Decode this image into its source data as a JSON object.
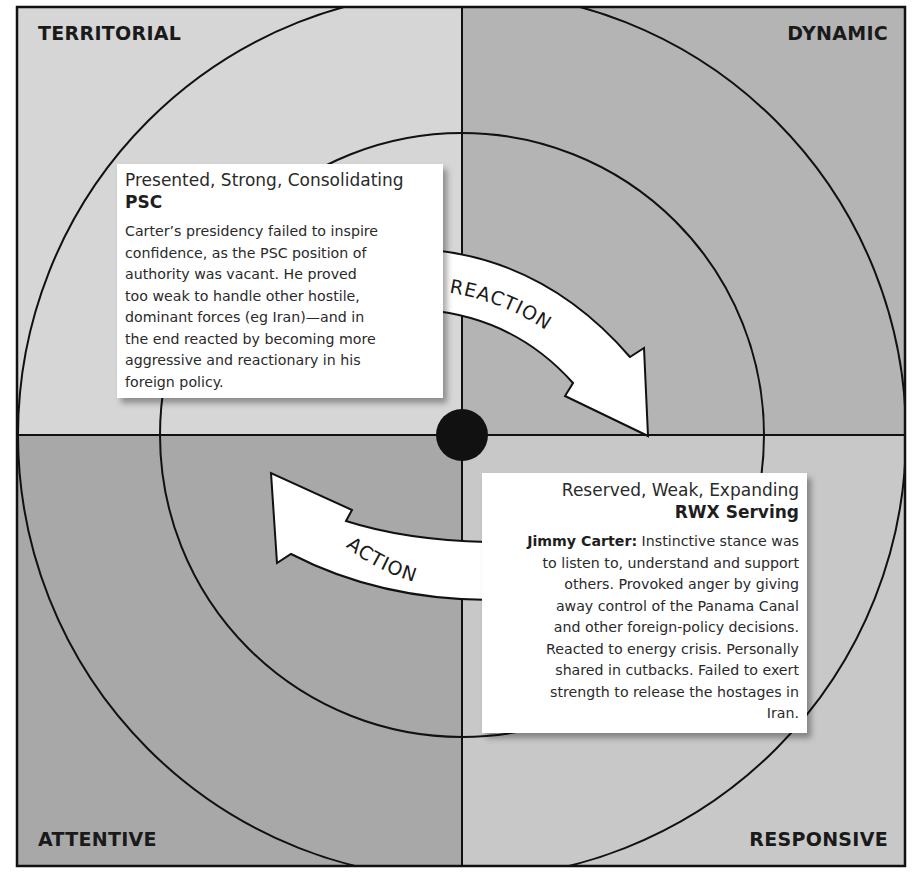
{
  "diagram": {
    "quadrants": {
      "top_left": {
        "label": "TERRITORIAL",
        "color": "#d6d6d6"
      },
      "top_right": {
        "label": "DYNAMIC",
        "color": "#b4b4b4"
      },
      "bottom_left": {
        "label": "ATTENTIVE",
        "color": "#a8a8a8"
      },
      "bottom_right": {
        "label": "RESPONSIVE",
        "color": "#c8c8c8"
      }
    },
    "arrows": {
      "reaction": {
        "label": "REACTION",
        "direction": "clockwise, top-left to right-center"
      },
      "action": {
        "label": "ACTION",
        "direction": "counter-clockwise, bottom-right to upper-left"
      }
    },
    "center_dot": {
      "color": "#111111"
    },
    "cards": {
      "psc": {
        "heading": "Presented, Strong, Consolidating",
        "code": "PSC",
        "body_lines": [
          "Carter’s presidency failed to inspire",
          "confidence, as the PSC position of",
          "authority was vacant. He proved",
          "too weak to handle other hostile,",
          "dominant forces (eg Iran)—and in",
          "the end reacted by becoming more",
          "aggressive and reactionary in his",
          "foreign policy."
        ]
      },
      "rwx": {
        "heading": "Reserved, Weak, Expanding",
        "code": "RWX Serving",
        "lead": "Jimmy Carter:",
        "body_lines": [
          " Instinctive stance was",
          "to listen to, understand and support",
          "others. Provoked anger by giving",
          "away control of the Panama Canal",
          "and other foreign-policy decisions.",
          "Reacted to energy crisis. Personally",
          "shared in cutbacks. Failed to exert",
          "strength to release the hostages in",
          "Iran."
        ]
      }
    }
  }
}
